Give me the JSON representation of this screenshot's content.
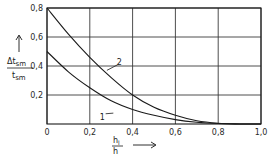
{
  "chart_data": {
    "type": "line",
    "title": "",
    "xlabel": "h_l / h",
    "xlabel_num": "h",
    "xlabel_num_sub": "l",
    "xlabel_den": "h",
    "ylabel": "Δt_sm / t_sm",
    "ylabel_num": "Δt",
    "ylabel_num_sub": "sm",
    "ylabel_den": "t",
    "ylabel_den_sub": "sm",
    "xlim": [
      0,
      1.0
    ],
    "ylim": [
      0,
      0.8
    ],
    "grid": true,
    "legend": "inline curve labels",
    "x_ticks": [
      "0",
      "0,2",
      "0,4",
      "0,6",
      "0,8",
      "1,0"
    ],
    "y_ticks": [
      "0,2",
      "0,4",
      "0,6",
      "0,8"
    ],
    "x": [
      0,
      0.1,
      0.2,
      0.3,
      0.4,
      0.5,
      0.6,
      0.7,
      0.8,
      0.9
    ],
    "series": [
      {
        "name": "1",
        "values": [
          0.5,
          0.36,
          0.25,
          0.16,
          0.1,
          0.06,
          0.03,
          0.012,
          0.003,
          0.0
        ]
      },
      {
        "name": "2",
        "values": [
          0.8,
          0.62,
          0.46,
          0.32,
          0.2,
          0.115,
          0.06,
          0.022,
          0.005,
          0.0
        ]
      }
    ],
    "annotations": [
      {
        "text": "1",
        "x": 0.26,
        "y": 0.05
      },
      {
        "text": "2",
        "x": 0.34,
        "y": 0.43
      }
    ]
  }
}
